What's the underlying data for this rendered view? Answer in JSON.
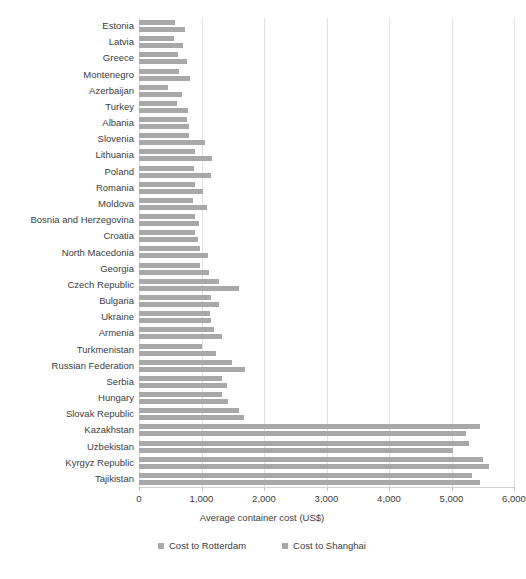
{
  "caption_remnant": " ",
  "axis": {
    "x_title": "Average container cost (US$)",
    "x_ticks": [
      "0",
      "1,000",
      "2,000",
      "3,000",
      "4,000",
      "5,000",
      "6,000"
    ]
  },
  "legend": {
    "items": [
      {
        "label": "Cost to Rotterdam",
        "color": "#a8a8a8"
      },
      {
        "label": "Cost to Shanghai",
        "color": "#a8a8a8"
      }
    ]
  },
  "colors": {
    "bar": "#a8a8a8",
    "grid": "#e2e2e2",
    "text": "#3d3d3d",
    "background": "#ffffff"
  },
  "chart_data": {
    "type": "bar",
    "orientation": "horizontal",
    "title": "",
    "xlabel": "Average container cost (US$)",
    "ylabel": "",
    "xlim": [
      0,
      6000
    ],
    "xticks": [
      0,
      1000,
      2000,
      3000,
      4000,
      5000,
      6000
    ],
    "grid": true,
    "legend_position": "bottom",
    "categories": [
      "Estonia",
      "Latvia",
      "Greece",
      "Montenegro",
      "Azerbaijan",
      "Turkey",
      "Albania",
      "Slovenia",
      "Lithuania",
      "Poland",
      "Romania",
      "Moldova",
      "Bosnia and Herzegovina",
      "Croatia",
      "North Macedonia",
      "Georgia",
      "Czech Republic",
      "Bulgaria",
      "Ukraine",
      "Armenia",
      "Turkmenistan",
      "Russian Federation",
      "Serbia",
      "Hungary",
      "Slovak Republic",
      "Kazakhstan",
      "Uzbekistan",
      "Kyrgyz Republic",
      "Tajikistan"
    ],
    "series": [
      {
        "name": "Cost to Rotterdam",
        "values": [
          580,
          560,
          620,
          640,
          470,
          600,
          760,
          800,
          900,
          880,
          900,
          860,
          900,
          900,
          980,
          980,
          1280,
          1150,
          1130,
          1200,
          1000,
          1480,
          1320,
          1320,
          1600,
          5450,
          5280,
          5500,
          5320
        ]
      },
      {
        "name": "Cost to Shanghai",
        "values": [
          740,
          700,
          760,
          810,
          690,
          780,
          800,
          1060,
          1160,
          1150,
          1030,
          1080,
          960,
          940,
          1100,
          1120,
          1600,
          1280,
          1150,
          1320,
          1230,
          1700,
          1400,
          1430,
          1680,
          5230,
          5020,
          5600,
          5450
        ]
      }
    ]
  }
}
